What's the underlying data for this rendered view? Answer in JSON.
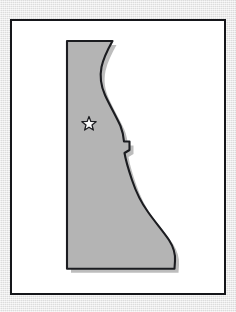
{
  "figure": {
    "alt_text": "Gray silhouette map of Delaware with a white star marking the capital",
    "width": 236,
    "height": 312
  },
  "frame": {
    "name": "map border frame",
    "border_color": "#15161a",
    "background_color": "#ffffff",
    "border_width_px": 2,
    "x": 10,
    "y": 19,
    "width": 216,
    "height": 276
  },
  "page": {
    "background_color": "#e8e8e8",
    "texture": "paper-grain"
  },
  "map": {
    "region_name": "Delaware",
    "fill_color": "#b4b4b4",
    "outline_color": "#1b1c20",
    "shadow_color": "rgba(90,90,90,0.40)",
    "shadow_offset_x": 4,
    "shadow_offset_y": 4,
    "outline_width_px": 2,
    "bounds": {
      "left": 67,
      "top": 41,
      "right": 175,
      "bottom": 269
    },
    "features": [
      "straight northern boundary",
      "straight western boundary",
      "concave eastern shoreline",
      "notch on mid-eastern boundary",
      "rounded southeastern cape",
      "straight southern boundary"
    ]
  },
  "markers": [
    {
      "id": "capital-star",
      "icon": "star-icon",
      "label": "",
      "shape": "five-pointed-star",
      "fill_color": "#fbfbfb",
      "outline_color": "#1b1c20",
      "center_x": 89,
      "center_y": 124,
      "size_px": 15
    }
  ],
  "legend": {
    "visible": false,
    "entries": []
  },
  "labels": {
    "visible": false,
    "entries": []
  }
}
